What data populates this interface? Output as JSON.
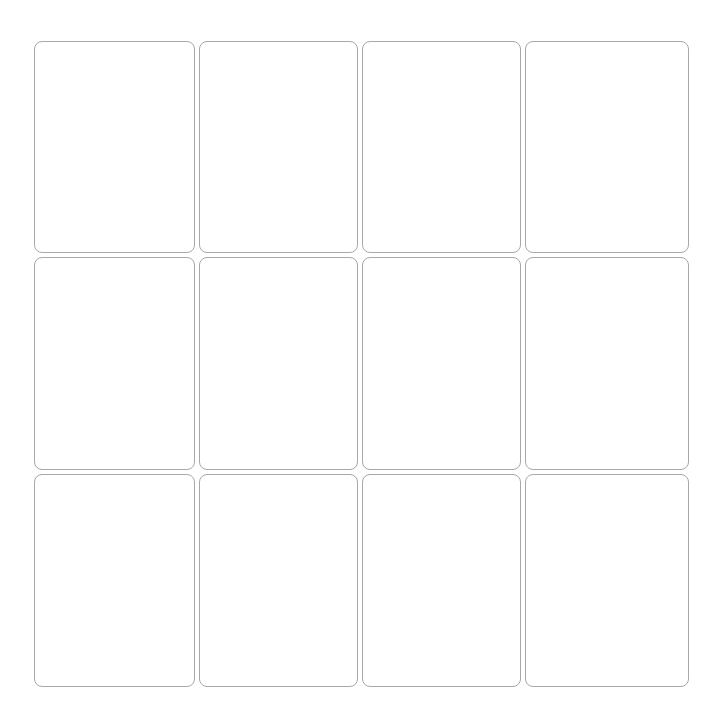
{
  "board": {
    "rows": 3,
    "columns": 4,
    "cards": [
      {
        "row": 1,
        "col": 1,
        "face": ""
      },
      {
        "row": 1,
        "col": 2,
        "face": ""
      },
      {
        "row": 1,
        "col": 3,
        "face": ""
      },
      {
        "row": 1,
        "col": 4,
        "face": ""
      },
      {
        "row": 2,
        "col": 1,
        "face": ""
      },
      {
        "row": 2,
        "col": 2,
        "face": ""
      },
      {
        "row": 2,
        "col": 3,
        "face": ""
      },
      {
        "row": 2,
        "col": 4,
        "face": ""
      },
      {
        "row": 3,
        "col": 1,
        "face": ""
      },
      {
        "row": 3,
        "col": 2,
        "face": ""
      },
      {
        "row": 3,
        "col": 3,
        "face": ""
      },
      {
        "row": 3,
        "col": 4,
        "face": ""
      }
    ]
  },
  "colors": {
    "background": "#ffffff",
    "card_border": "#a8a8a8",
    "card_fill": "#ffffff"
  }
}
